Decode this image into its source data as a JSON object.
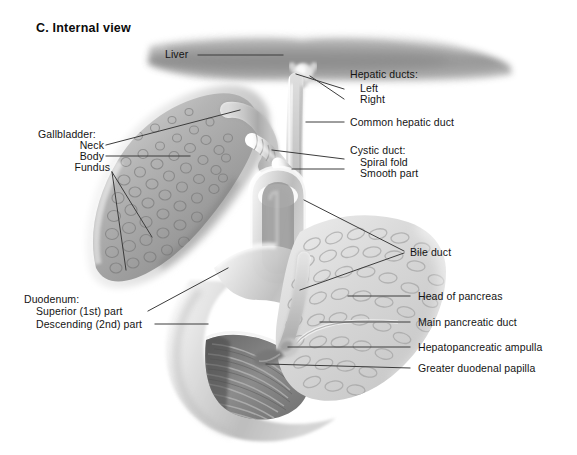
{
  "figure": {
    "title": "C. Internal view",
    "background_color": "#ffffff",
    "text_color": "#141414",
    "leader_line_color": "#3c3c3c"
  },
  "labels": {
    "liver": "Liver",
    "hepatic_ducts_heading": "Hepatic ducts:",
    "hepatic_duct_left": "Left",
    "hepatic_duct_right": "Right",
    "common_hepatic_duct": "Common hepatic duct",
    "cystic_duct_heading": "Cystic duct:",
    "cystic_duct_spiral_fold": "Spiral fold",
    "cystic_duct_smooth_part": "Smooth part",
    "bile_duct": "Bile duct",
    "head_of_pancreas": "Head of pancreas",
    "main_pancreatic_duct": "Main pancreatic duct",
    "hepatopancreatic_ampulla": "Hepatopancreatic ampulla",
    "greater_duodenal_papilla": "Greater duodenal papilla",
    "gallbladder_heading": "Gallbladder:",
    "gallbladder_neck": "Neck",
    "gallbladder_body": "Body",
    "gallbladder_fundus": "Fundus",
    "duodenum_heading": "Duodenum:",
    "duodenum_superior": "Superior (1st) part",
    "duodenum_descending": "Descending (2nd) part"
  },
  "structures": {
    "liver": "liver-inferior-surface",
    "gallbladder": "gallbladder-opened-mucosa",
    "duodenum": "duodenum-opened-c-loop",
    "pancreas": "pancreas-head-lobulated",
    "ducts": "biliary-duct-tree"
  }
}
